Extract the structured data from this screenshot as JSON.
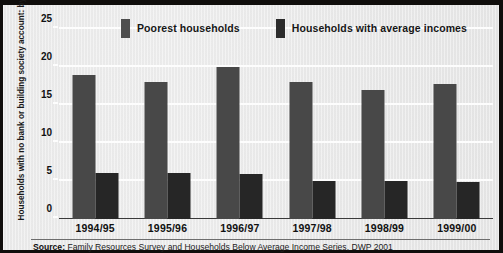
{
  "chart_data": {
    "type": "bar",
    "title": "",
    "subtitle": "",
    "xlabel": "",
    "ylabel": "Households with no bank or building society account: by income (per cent)",
    "ylim": [
      0,
      25
    ],
    "yticks": [
      0,
      5,
      10,
      15,
      20,
      25
    ],
    "ytick_labels": [
      "0",
      "5",
      "10",
      "15",
      "20",
      "25"
    ],
    "grid": true,
    "legend_position": "top",
    "categories": [
      "1994/95",
      "1995/96",
      "1996/97",
      "1997/98",
      "1998/99",
      "1999/00"
    ],
    "series": [
      {
        "name": "Poorest households",
        "color": "#484848",
        "values": [
          19,
          18,
          20,
          18,
          17,
          17.8
        ]
      },
      {
        "name": "Households with average incomes",
        "color": "#262626",
        "values": [
          6,
          6,
          5.9,
          5,
          5,
          4.9
        ]
      }
    ],
    "source": {
      "prefix": "Source:",
      "text": " Family Resources Survey and Households Below Average Income Series, DWP 2001"
    }
  },
  "colors": {
    "poorest": "#484848",
    "average": "#262626",
    "plate": "#ebebeb",
    "frame": "#100e0c",
    "gridline": "#fdfdfd",
    "baseline": "#3a3a3a"
  }
}
